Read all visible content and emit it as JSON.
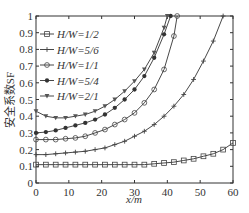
{
  "chart_data": {
    "type": "line",
    "title": "",
    "xlabel": "x/m",
    "ylabel": "安全系数SF",
    "xlim": [
      0,
      60
    ],
    "ylim": [
      0,
      1
    ],
    "xticks": [
      0,
      10,
      20,
      30,
      40,
      50,
      60
    ],
    "yticks": [
      0,
      0.1,
      0.2,
      0.3,
      0.4,
      0.5,
      0.6,
      0.7,
      0.8,
      0.9,
      1
    ],
    "grid": false,
    "legend_position": "upper left",
    "series": [
      {
        "name": "H/W=1/2",
        "marker": "square",
        "x": [
          0,
          3,
          6,
          9,
          12,
          15,
          18,
          21,
          24,
          27,
          30,
          33,
          36,
          39,
          42,
          45,
          48,
          51,
          54,
          57,
          60
        ],
        "y": [
          0.11,
          0.11,
          0.11,
          0.11,
          0.11,
          0.11,
          0.11,
          0.11,
          0.11,
          0.11,
          0.11,
          0.11,
          0.115,
          0.12,
          0.125,
          0.135,
          0.145,
          0.16,
          0.175,
          0.2,
          0.24
        ]
      },
      {
        "name": "H/W=5/6",
        "marker": "plus",
        "x": [
          0,
          3,
          6,
          9,
          12,
          15,
          18,
          21,
          24,
          27,
          30,
          33,
          36,
          39,
          42,
          45,
          48,
          51,
          54,
          57
        ],
        "y": [
          0.17,
          0.17,
          0.175,
          0.18,
          0.185,
          0.19,
          0.2,
          0.21,
          0.23,
          0.25,
          0.28,
          0.31,
          0.35,
          0.4,
          0.46,
          0.53,
          0.62,
          0.73,
          0.85,
          1.0
        ]
      },
      {
        "name": "H/W=1/1",
        "marker": "diamond",
        "x": [
          0,
          3,
          6,
          9,
          12,
          15,
          18,
          21,
          24,
          27,
          30,
          33,
          36,
          39,
          42,
          43
        ],
        "y": [
          0.26,
          0.26,
          0.26,
          0.265,
          0.27,
          0.28,
          0.3,
          0.32,
          0.35,
          0.38,
          0.42,
          0.48,
          0.56,
          0.68,
          0.88,
          1.0
        ]
      },
      {
        "name": "H/W=5/4",
        "marker": "filled-circle",
        "x": [
          0,
          3,
          6,
          9,
          12,
          15,
          18,
          21,
          24,
          27,
          30,
          33,
          36,
          39,
          41
        ],
        "y": [
          0.3,
          0.305,
          0.315,
          0.33,
          0.345,
          0.36,
          0.38,
          0.41,
          0.45,
          0.5,
          0.56,
          0.64,
          0.75,
          0.89,
          1.0
        ]
      },
      {
        "name": "H/W=2/1",
        "marker": "triangle-down",
        "x": [
          0,
          3,
          6,
          9,
          12,
          15,
          18,
          21,
          24,
          27,
          30,
          33,
          36,
          39,
          40
        ],
        "y": [
          0.43,
          0.4,
          0.39,
          0.39,
          0.4,
          0.41,
          0.43,
          0.46,
          0.5,
          0.55,
          0.61,
          0.68,
          0.78,
          0.93,
          1.0
        ]
      }
    ]
  }
}
